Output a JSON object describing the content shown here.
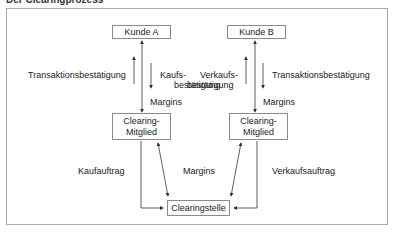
{
  "title": "Der Clearingprozess",
  "nodes": {
    "kunde_a": "Kunde A",
    "kunde_b": "Kunde B",
    "clearing_mitglied_left": "Clearing-\nMitglied",
    "clearing_mitglied_left_l1": "Clearing-",
    "clearing_mitglied_left_l2": "Mitglied",
    "clearing_mitglied_right_l1": "Clearing-",
    "clearing_mitglied_right_l2": "Mitglied",
    "clearingstelle": "Clearingstelle"
  },
  "labels": {
    "left_transaktion": "Transaktionsbestätigung",
    "left_kaufs_l1": "Kaufs-",
    "left_kaufs_l2": "bestätigung",
    "left_margins": "Margins",
    "right_verkaufs_l1": "Verkaufs-",
    "right_verkaufs_l2": "bestätigung",
    "right_transaktion": "Transaktionsbestätigung",
    "right_margins": "Margins",
    "kaufauftrag": "Kaufauftrag",
    "center_margins": "Margins",
    "verkaufsauftrag": "Verkaufsauftrag"
  },
  "colors": {
    "line": "#333333",
    "border": "#8a8a8a"
  }
}
